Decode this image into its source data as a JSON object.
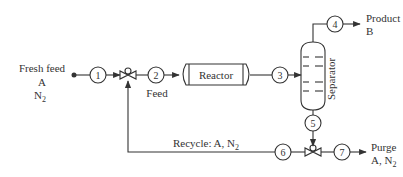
{
  "diagram": {
    "type": "process-flow-diagram",
    "fresh_feed": {
      "title": "Fresh feed",
      "line1": "A",
      "line2_base": "N",
      "line2_sub": "2"
    },
    "feed_label": "Feed",
    "reactor_label": "Reactor",
    "separator_label": "Separator",
    "product": {
      "title": "Product",
      "line1": "B"
    },
    "recycle": {
      "prefix": "Recycle: A, N",
      "sub": "2"
    },
    "purge": {
      "title": "Purge",
      "line1_base": "A, N",
      "line1_sub": "2"
    },
    "streams": [
      "1",
      "2",
      "3",
      "4",
      "5",
      "6",
      "7"
    ],
    "colors": {
      "stroke": "#333333",
      "background": "#ffffff"
    }
  }
}
